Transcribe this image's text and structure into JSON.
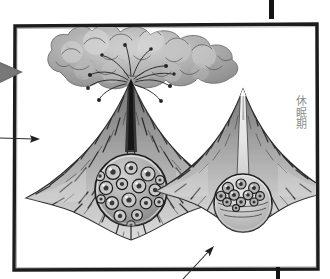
{
  "illustration": {
    "title": "volcano-cross-section-illustration",
    "medium": "hand-drawn pencil-and-ink grayscale sketch",
    "frame": {
      "style": "hand-drawn rectangular ink border",
      "color": "#1a1a1a",
      "fill": "#ffffff",
      "x": 14,
      "y": 25,
      "width": 304,
      "height": 245
    },
    "background_color": "#ffffff"
  },
  "labels": {
    "dormant_stage": "休眠期"
  },
  "figures": [
    {
      "id": "erupting-volcano",
      "name": "erupting-volcano",
      "state": "erupting",
      "center_x": 130,
      "summit_y": 78,
      "has_ash_cloud": true,
      "has_ejecta": true,
      "conduit": "filled-dark",
      "magma_chamber": {
        "fill_level": "full",
        "bubble_count": 17,
        "center_x": 131,
        "center_y": 190,
        "radius": 36
      }
    },
    {
      "id": "dormant-volcano",
      "name": "dormant-volcano",
      "state": "dormant",
      "center_x": 243,
      "summit_y": 87,
      "has_ash_cloud": false,
      "has_ejecta": false,
      "conduit": "open-light",
      "magma_chamber": {
        "fill_level": "partial",
        "bubble_count": 11,
        "center_x": 243,
        "center_y": 203,
        "radius": 29
      }
    }
  ],
  "annotations": [
    {
      "id": "left-pointer-arrow",
      "name": "left-pointer-arrow",
      "direction": "right",
      "from_x": 0,
      "from_y": 138,
      "to_x": 40,
      "to_y": 139,
      "color": "#2b2b2b"
    },
    {
      "id": "bottom-pointer-arrow",
      "name": "bottom-pointer-arrow",
      "direction": "up-right",
      "from_x": 183,
      "from_y": 279,
      "to_x": 214,
      "to_y": 247,
      "color": "#2b2b2b"
    }
  ],
  "markers": {
    "cursor": {
      "name": "gray-cursor-arrow",
      "x": 0,
      "y": 61,
      "width": 24,
      "height": 23,
      "color": "#6e6e6e"
    },
    "top_tick": {
      "name": "top-edge-tick-mark",
      "x": 269,
      "y": 0,
      "width": 5,
      "height": 19,
      "color": "#141414"
    },
    "bottom_tick": {
      "name": "bottom-edge-tick-mark",
      "x": 276,
      "y": 267,
      "width": 4,
      "height": 12,
      "color": "#141414"
    }
  },
  "palette": {
    "ink": "#1a1a1a",
    "ash_cloud": "#a6a6a6",
    "ash_cloud_light": "#d2d2d2",
    "ash_cloud_shadow": "#8a8a8a",
    "slope_dark": "#3b3b3b",
    "slope_mid": "#8f8f8f",
    "slope_light": "#cfcfcf",
    "chamber_fill": "#b5b5b5",
    "chamber_light": "#e6e6e6",
    "label_text": "#8d8d8d",
    "paper": "#ffffff"
  }
}
